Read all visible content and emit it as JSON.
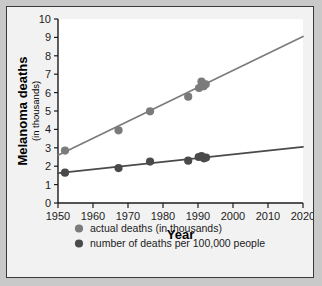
{
  "chart_data": {
    "type": "scatter",
    "title": "",
    "xlabel": "Year",
    "ylabel": "Melanoma deaths",
    "ylabel_sub": "(in thousands)",
    "xlim": [
      1950,
      2020
    ],
    "ylim": [
      0,
      10
    ],
    "xticks": [
      1950,
      1960,
      1970,
      1980,
      1990,
      2000,
      2010,
      2020
    ],
    "xtick_labels": [
      "1950",
      "1960",
      "1970",
      "1980",
      "1990",
      "2000",
      "2010",
      "2020"
    ],
    "yticks": [
      0,
      1,
      2,
      3,
      4,
      5,
      6,
      7,
      8,
      9,
      10
    ],
    "ytick_labels": [
      "0",
      "1",
      "2",
      "3",
      "4",
      "5",
      "6",
      "7",
      "8",
      "9",
      "10"
    ],
    "grid": false,
    "legend_position": "below",
    "series": [
      {
        "name": "actual deaths (in thousands)",
        "color": "#7b7b7b",
        "marker": "circle",
        "points": [
          {
            "x": 1952.0,
            "y": 2.85
          },
          {
            "x": 1967.3,
            "y": 3.95
          },
          {
            "x": 1976.3,
            "y": 4.98
          },
          {
            "x": 1987.2,
            "y": 5.78
          },
          {
            "x": 1990.3,
            "y": 6.25
          },
          {
            "x": 1991.0,
            "y": 6.6
          },
          {
            "x": 1991.6,
            "y": 6.35
          },
          {
            "x": 1992.2,
            "y": 6.45
          }
        ],
        "trend_line": {
          "x0": 1950,
          "y0": 2.6,
          "x1": 2020,
          "y1": 9.05
        }
      },
      {
        "name": "number of deaths per 100,000 people",
        "color": "#4a4a4a",
        "marker": "circle",
        "points": [
          {
            "x": 1952.0,
            "y": 1.65
          },
          {
            "x": 1967.3,
            "y": 1.9
          },
          {
            "x": 1976.3,
            "y": 2.25
          },
          {
            "x": 1987.2,
            "y": 2.3
          },
          {
            "x": 1990.2,
            "y": 2.5
          },
          {
            "x": 1991.0,
            "y": 2.55
          },
          {
            "x": 1991.7,
            "y": 2.43
          },
          {
            "x": 1992.3,
            "y": 2.47
          }
        ],
        "trend_line": {
          "x0": 1950,
          "y0": 1.62,
          "x1": 2020,
          "y1": 3.05
        }
      }
    ],
    "legend": [
      {
        "label": "actual deaths (in thousands)",
        "color": "#7b7b7b"
      },
      {
        "label": "number of deaths per 100,000 people",
        "color": "#4a4a4a"
      }
    ]
  },
  "figure": {
    "background": "#f2f2f2",
    "plot_background": "#ffffff",
    "border_color": "#3a3a3a",
    "axis_color": "#1c1c1c"
  }
}
